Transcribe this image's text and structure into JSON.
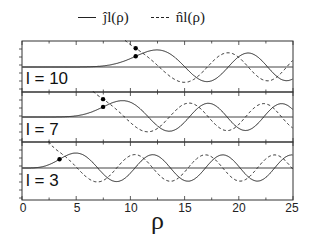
{
  "chart_data": {
    "type": "line",
    "title": "",
    "xlabel": "ρ",
    "ylabel": "",
    "xlim": [
      0,
      25
    ],
    "xticks": [
      0,
      5,
      10,
      15,
      20,
      25
    ],
    "xtick_labels": [
      "0",
      "5",
      "10",
      "15",
      "20",
      "25"
    ],
    "grid": false,
    "legend_position": "top",
    "legend": [
      {
        "label": "ĵ_l(ρ)",
        "style": "solid"
      },
      {
        "label": "n̂_l(ρ)",
        "style": "dashed"
      }
    ],
    "panels": [
      {
        "label": "l = 10",
        "l": 10,
        "turning_point_rho": 10.49,
        "annotation": "dots at ρ = √(l(l+1))"
      },
      {
        "label": "l = 7",
        "l": 7,
        "turning_point_rho": 7.48,
        "annotation": "dots at ρ = √(l(l+1))"
      },
      {
        "label": "l = 3",
        "l": 3,
        "turning_point_rho": 3.46,
        "annotation": "dots at ρ = √(l(l+1))"
      }
    ],
    "series": [
      {
        "name": "ĵ_l(ρ) (Riccati–Bessel, regular)",
        "style": "solid",
        "description": "≈0 for ρ < √(l(l+1)), then oscillates with amplitude ≈1, period 2π"
      },
      {
        "name": "n̂_l(ρ) (Riccati–Neumann, irregular)",
        "style": "dashed",
        "description": "diverges as ρ→0, oscillates with amplitude ≈1, phase-shifted by π/2 from ĵ_l"
      }
    ]
  },
  "legend": {
    "j_label": "ĵl(ρ)",
    "n_label": "n̂l(ρ)"
  },
  "panels": {
    "p0": {
      "label": "l = 10"
    },
    "p1": {
      "label": "l = 7"
    },
    "p2": {
      "label": "l = 3"
    }
  },
  "axis": {
    "xlabel": "ρ",
    "ticks": [
      "0",
      "5",
      "10",
      "15",
      "20",
      "25"
    ]
  }
}
